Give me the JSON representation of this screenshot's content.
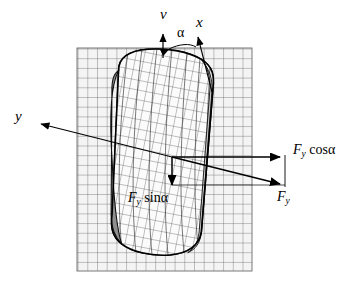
{
  "figure": {
    "type": "free-body-diagram",
    "background": "#ffffff",
    "line_color": "#000000",
    "grid_color": "#4a4a4a",
    "pad_fill": "#f2f2f2"
  },
  "labels": {
    "v": "v",
    "alpha": "α",
    "x": "x",
    "y": "y",
    "fy": {
      "f": "F",
      "sub": "y"
    },
    "fy_cos_alpha": {
      "f": "F",
      "sub": "y",
      "fn": "cos",
      "gk": "α"
    },
    "fy_sin_alpha": {
      "f": "F",
      "sub": "y",
      "fn": "sin",
      "gk": "α"
    }
  },
  "geometry": {
    "grid": {
      "x": 77,
      "y": 48,
      "w": 175,
      "h": 223,
      "cell": 9.7
    },
    "origin": {
      "x": 172,
      "y": 157
    },
    "v_axis": {
      "x": 163,
      "tip_y": 31,
      "base_y": 52
    },
    "x_axis": {
      "tip_x": 197,
      "tip_y": 34,
      "base_x": 207,
      "base_y": 66
    },
    "y_arrow_tip": {
      "x": 37,
      "y": 123
    },
    "fy_tip": {
      "x": 285,
      "y": 185
    },
    "fy_cos_tip": {
      "x": 285,
      "y": 157
    },
    "fy_sin_tip": {
      "x": 172,
      "y": 190
    },
    "tire": {
      "cx": 168,
      "cy": 155,
      "rx": 48,
      "ry": 98,
      "rot_deg": 11
    }
  },
  "label_positions": {
    "v": {
      "left": 160,
      "top": 8
    },
    "alpha": {
      "left": 176,
      "top": 27
    },
    "x": {
      "left": 196,
      "top": 16
    },
    "y": {
      "left": 16,
      "top": 110
    },
    "fy_cos": {
      "left": 292,
      "top": 143
    },
    "fy": {
      "left": 277,
      "top": 190
    },
    "fy_sin": {
      "left": 128,
      "top": 190
    }
  }
}
